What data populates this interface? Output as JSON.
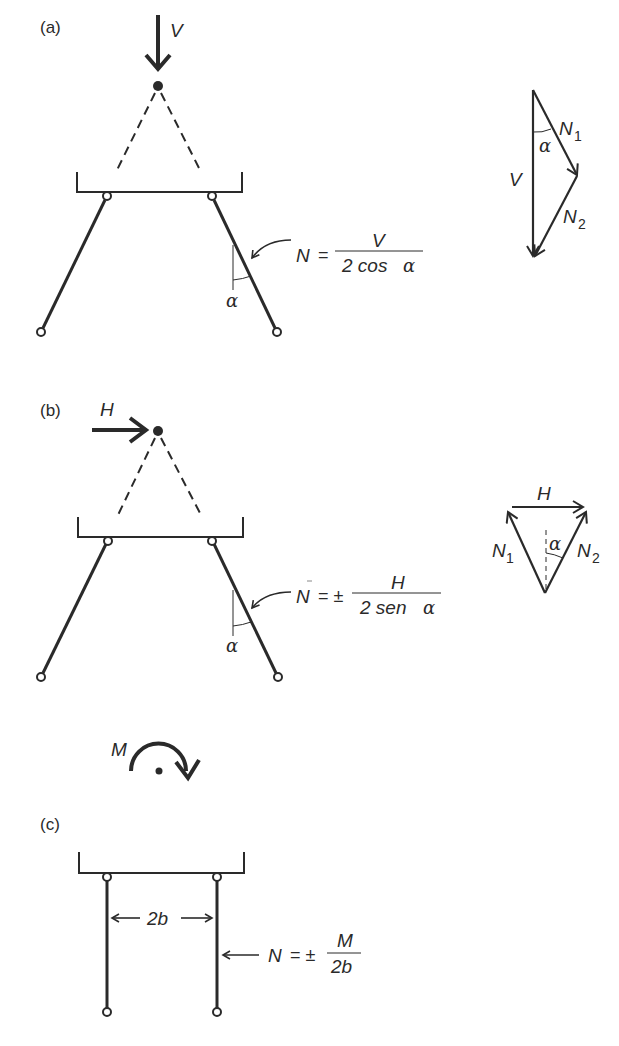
{
  "panels": {
    "a": {
      "label": "(a)",
      "load_symbol": "V",
      "angle_symbol": "α",
      "formula": {
        "lhs": "N",
        "eq": "=",
        "numerator": "V",
        "denominator_prefix": "2 cos ",
        "denominator_angle": "α"
      },
      "force_triangle": {
        "resultant": "V",
        "n1": "N",
        "n1_sub": "1",
        "n2": "N",
        "n2_sub": "2",
        "angle": "α"
      }
    },
    "b": {
      "label": "(b)",
      "load_symbol": "H",
      "angle_symbol": "α",
      "formula": {
        "lhs": "N",
        "eq": "= ±",
        "numerator": "H",
        "denominator_prefix": "2 sen ",
        "denominator_angle": "α"
      },
      "force_triangle": {
        "resultant": "H",
        "n1": "N",
        "n1_sub": "1",
        "n2": "N",
        "n2_sub": "2",
        "angle": "α"
      }
    },
    "c": {
      "label": "(c)",
      "moment_symbol": "M",
      "spacing_label": "2b",
      "formula": {
        "lhs": "N",
        "eq": "= ±",
        "numerator": "M",
        "denominator": "2b"
      }
    }
  },
  "colors": {
    "ink": "#2a2a2a",
    "background": "#ffffff"
  }
}
